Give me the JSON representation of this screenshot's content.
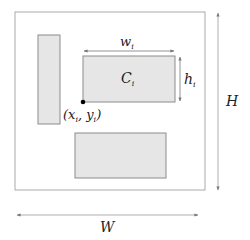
{
  "diagram": {
    "container": {
      "label": "W",
      "height_label": "H"
    },
    "colors": {
      "stroke": "#8c8c8c",
      "fill": "#e6e6e6",
      "text": "#222222",
      "point": "#000000"
    },
    "rectangles": [
      {
        "name": "tall-rect",
        "label": ""
      },
      {
        "name": "component-rect",
        "label": "C",
        "subscript": "i",
        "width_label": "w",
        "width_sub": "i",
        "height_label": "h",
        "height_sub": "i"
      },
      {
        "name": "lower-rect",
        "label": ""
      }
    ],
    "anchor_point": {
      "label": "(x",
      "x_sub": "i",
      "sep": ", y",
      "y_sub": "i",
      "close": ")"
    }
  }
}
